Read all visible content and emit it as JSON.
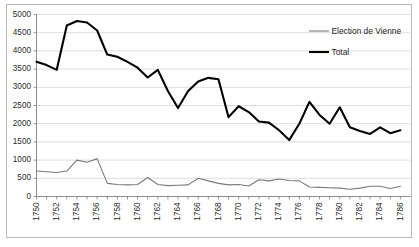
{
  "chart_data": {
    "type": "line",
    "title": "",
    "subtitle": "",
    "xlabel": "",
    "ylabel": "",
    "xlim": [
      1750,
      1787
    ],
    "ylim": [
      0,
      5000
    ],
    "ytick_step": 500,
    "grid": true,
    "legend_position": "upper-right-inside",
    "x": [
      1750,
      1751,
      1752,
      1753,
      1754,
      1755,
      1756,
      1757,
      1758,
      1759,
      1760,
      1761,
      1762,
      1763,
      1764,
      1765,
      1766,
      1767,
      1768,
      1769,
      1770,
      1771,
      1772,
      1773,
      1774,
      1775,
      1776,
      1777,
      1778,
      1779,
      1780,
      1781,
      1782,
      1783,
      1784,
      1785,
      1786
    ],
    "xtick_labels": [
      "1750",
      "",
      "1752",
      "",
      "1754",
      "",
      "1756",
      "",
      "1758",
      "",
      "1760",
      "",
      "1762",
      "",
      "1764",
      "",
      "1766",
      "",
      "1768",
      "",
      "1770",
      "",
      "1772",
      "",
      "1774",
      "",
      "1776",
      "",
      "1778",
      "",
      "1780",
      "",
      "1782",
      "",
      "1784",
      "",
      "1786"
    ],
    "xtick_labels_shown": [
      "1750",
      "1752",
      "1754",
      "1756",
      "1758",
      "1760",
      "1762",
      "1764",
      "1766",
      "1768",
      "1770",
      "1772",
      "1774",
      "1776",
      "1778",
      "1780",
      "1782",
      "1784",
      "1786"
    ],
    "ytick_labels": [
      "0",
      "500",
      "1000",
      "1500",
      "2000",
      "2500",
      "3000",
      "3500",
      "4000",
      "4500",
      "5000"
    ],
    "ytick_values": [
      0,
      500,
      1000,
      1500,
      2000,
      2500,
      3000,
      3500,
      4000,
      4500,
      5000
    ],
    "series": [
      {
        "name": "Election de Vienne",
        "color": "#7a7a7a",
        "linewidth": 1.1,
        "values": [
          700,
          680,
          660,
          700,
          1000,
          940,
          1040,
          360,
          330,
          320,
          330,
          520,
          330,
          300,
          310,
          320,
          500,
          430,
          360,
          320,
          330,
          290,
          460,
          430,
          480,
          440,
          430,
          260,
          250,
          240,
          230,
          200,
          230,
          280,
          280,
          220,
          280
        ]
      },
      {
        "name": "Total",
        "color": "#000000",
        "linewidth": 2.1,
        "values": [
          3700,
          3610,
          3480,
          4700,
          4820,
          4780,
          4560,
          3900,
          3840,
          3700,
          3540,
          3270,
          3480,
          2900,
          2430,
          2900,
          3160,
          3260,
          3220,
          2180,
          2480,
          2320,
          2060,
          2030,
          1820,
          1550,
          2000,
          2600,
          2240,
          2000,
          2450,
          1900,
          1800,
          1720,
          1900,
          1740,
          1820
        ]
      }
    ]
  },
  "legend": {
    "entries": [
      {
        "label": "Election de Vienne",
        "color": "#7a7a7a"
      },
      {
        "label": "Total",
        "color": "#000000"
      }
    ]
  }
}
